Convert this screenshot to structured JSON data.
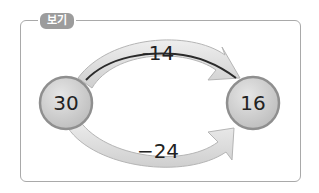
{
  "label": "보기",
  "start_value": "30",
  "end_value": "16",
  "top_arrow_label": "-14",
  "bottom_arrow_label": "−24",
  "colors": {
    "frame": "#a9a9a9",
    "tag": "#9c9c9c",
    "arrow_fill": "#dcdcdc",
    "circle_fill": "#d4d4d4",
    "circle_stroke": "#8f8f8f",
    "line": "#2a2a2a"
  }
}
